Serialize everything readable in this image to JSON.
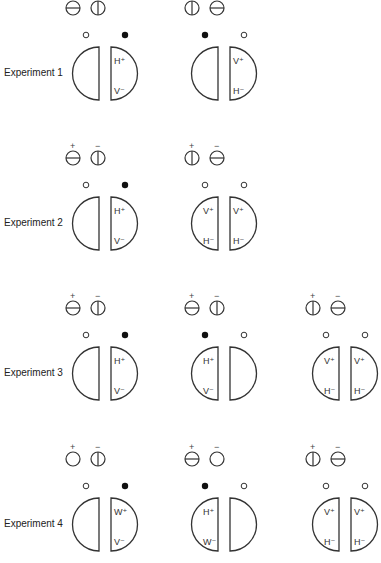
{
  "figure": {
    "experiments": [
      {
        "label": "Experiment 1",
        "panels": [
          {
            "filters": [
              {
                "type": "horizontal",
                "sign": ""
              },
              {
                "type": "vertical",
                "sign": ""
              }
            ],
            "left": {
              "indicator": "open",
              "top": "",
              "bottom": ""
            },
            "right": {
              "indicator": "filled",
              "top": "H⁺",
              "bottom": "V⁻"
            }
          },
          {
            "filters": [
              {
                "type": "vertical",
                "sign": ""
              },
              {
                "type": "horizontal",
                "sign": ""
              }
            ],
            "left": {
              "indicator": "filled",
              "top": "",
              "bottom": ""
            },
            "right": {
              "indicator": "open",
              "top": "V⁺",
              "bottom": "H⁻"
            }
          }
        ]
      },
      {
        "label": "Experiment 2",
        "panels": [
          {
            "filters": [
              {
                "type": "horizontal",
                "sign": "+"
              },
              {
                "type": "vertical",
                "sign": "−"
              }
            ],
            "left": {
              "indicator": "open",
              "top": "",
              "bottom": ""
            },
            "right": {
              "indicator": "filled",
              "top": "H⁺",
              "bottom": "V⁻"
            }
          },
          {
            "filters": [
              {
                "type": "vertical",
                "sign": "+"
              },
              {
                "type": "horizontal",
                "sign": "−"
              }
            ],
            "left": {
              "indicator": "open",
              "top": "V⁺",
              "bottom": "H⁻"
            },
            "right": {
              "indicator": "open",
              "top": "V⁺",
              "bottom": "H⁻"
            }
          }
        ]
      },
      {
        "label": "Experiment 3",
        "panels": [
          {
            "filters": [
              {
                "type": "horizontal",
                "sign": "+"
              },
              {
                "type": "vertical",
                "sign": "−"
              }
            ],
            "left": {
              "indicator": "open",
              "top": "",
              "bottom": ""
            },
            "right": {
              "indicator": "filled",
              "top": "H⁺",
              "bottom": "V⁻"
            }
          },
          {
            "filters": [
              {
                "type": "horizontal",
                "sign": "+"
              },
              {
                "type": "vertical",
                "sign": "−"
              }
            ],
            "left": {
              "indicator": "filled",
              "top": "H⁺",
              "bottom": "V⁻"
            },
            "right": {
              "indicator": "open",
              "top": "",
              "bottom": ""
            }
          },
          {
            "filters": [
              {
                "type": "vertical",
                "sign": "+"
              },
              {
                "type": "horizontal",
                "sign": "−"
              }
            ],
            "left": {
              "indicator": "open",
              "top": "V⁺",
              "bottom": "H⁻"
            },
            "right": {
              "indicator": "open",
              "top": "V⁺",
              "bottom": "H⁻"
            }
          }
        ]
      },
      {
        "label": "Experiment 4",
        "panels": [
          {
            "filters": [
              {
                "type": "empty",
                "sign": "+"
              },
              {
                "type": "vertical",
                "sign": "−"
              }
            ],
            "left": {
              "indicator": "open",
              "top": "",
              "bottom": ""
            },
            "right": {
              "indicator": "filled",
              "top": "W⁺",
              "bottom": "V⁻"
            }
          },
          {
            "filters": [
              {
                "type": "horizontal",
                "sign": "+"
              },
              {
                "type": "empty",
                "sign": "−"
              }
            ],
            "left": {
              "indicator": "filled",
              "top": "H⁺",
              "bottom": "W⁻"
            },
            "right": {
              "indicator": "open",
              "top": "",
              "bottom": ""
            }
          },
          {
            "filters": [
              {
                "type": "vertical",
                "sign": "+"
              },
              {
                "type": "horizontal",
                "sign": "−"
              }
            ],
            "left": {
              "indicator": "open",
              "top": "V⁺",
              "bottom": "H⁻"
            },
            "right": {
              "indicator": "open",
              "top": "V⁺",
              "bottom": "H⁻"
            }
          }
        ]
      }
    ]
  },
  "style": {
    "stroke": "#333333",
    "fill_dot": "#111111",
    "background": "#ffffff"
  },
  "layout": {
    "rows_y": [
      0,
      150,
      300,
      451
    ],
    "panel_x": [
      66,
      185,
      306
    ]
  }
}
